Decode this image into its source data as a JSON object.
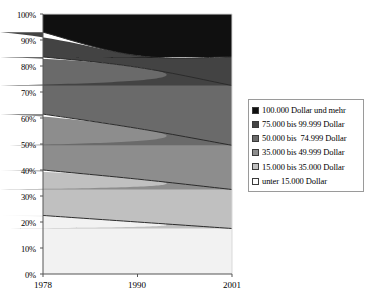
{
  "chart_data": {
    "type": "area",
    "stacked": true,
    "normalized": true,
    "title": "",
    "xlabel": "",
    "ylabel": "",
    "categories": [
      "1978",
      "1990",
      "2001"
    ],
    "x": [
      1978,
      1990,
      2001
    ],
    "ylim": [
      0,
      100
    ],
    "ytick_labels": [
      "0%",
      "10%",
      "20%",
      "30%",
      "40%",
      "50%",
      "60%",
      "70%",
      "80%",
      "90%",
      "100%"
    ],
    "ytick_values": [
      0,
      10,
      20,
      30,
      40,
      50,
      60,
      70,
      80,
      90,
      100
    ],
    "xtick_labels": [
      "1978",
      "1990",
      "2001"
    ],
    "grid": false,
    "legend_position": "right",
    "series": [
      {
        "name": "unter 15.000 Dollar",
        "color": "#f2f2f2",
        "values": [
          22.5,
          20.0,
          17.5
        ],
        "cumulative": [
          22.5,
          20.0,
          17.5
        ]
      },
      {
        "name": "15.000 bis 35.000 Dollar",
        "color": "#c0c0c0",
        "values": [
          17.5,
          16.5,
          15.0
        ],
        "cumulative": [
          40.0,
          36.5,
          32.5
        ]
      },
      {
        "name": "35.000 bis 49.999 Dollar",
        "color": "#8d8d8d",
        "values": [
          21.5,
          19.5,
          17.0
        ],
        "cumulative": [
          61.5,
          56.0,
          49.5
        ]
      },
      {
        "name": "50.000 bis  74.999 Dollar",
        "color": "#6a6a6a",
        "values": [
          22.0,
          23.5,
          23.0
        ],
        "cumulative": [
          83.5,
          79.5,
          72.5
        ]
      },
      {
        "name": "75.000 bis 99.999 Dollar",
        "color": "#434343",
        "values": [
          9.5,
          4.5,
          11.0
        ],
        "cumulative": [
          93.0,
          84.0,
          83.5
        ]
      },
      {
        "name": "100.000 Dollar und mehr",
        "color": "#101010",
        "values": [
          7.0,
          16.0,
          16.5
        ],
        "cumulative": [
          100.0,
          100.0,
          100.0
        ]
      }
    ],
    "legend_entries": [
      {
        "label": "100.000 Dollar und mehr",
        "color": "#101010"
      },
      {
        "label": "75.000 bis 99.999 Dollar",
        "color": "#434343"
      },
      {
        "label": "50.000 bis  74.999 Dollar",
        "color": "#6a6a6a"
      },
      {
        "label": "35.000 bis 49.999 Dollar",
        "color": "#8d8d8d"
      },
      {
        "label": "15.000 bis 35.000 Dollar",
        "color": "#c0c0c0"
      },
      {
        "label": "unter 15.000 Dollar",
        "color": "#fbfbfb"
      }
    ],
    "axis_color": "#555555",
    "band_edge_color": "#2b2b2b"
  },
  "plot_geometry": {
    "left": 43,
    "right": 232,
    "top": 14,
    "bottom": 274
  }
}
